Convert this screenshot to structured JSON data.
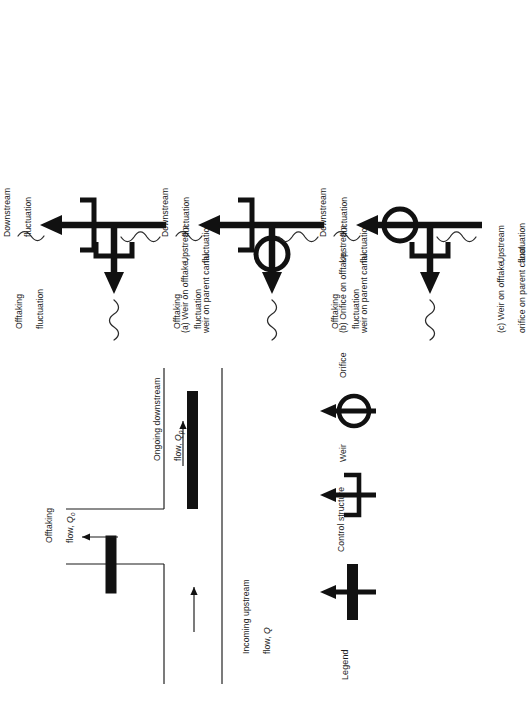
{
  "figure": {
    "type": "engineering-schematic",
    "orientation": "rotated-90-ccw",
    "background": "#ffffff",
    "ink_color": "#111111"
  },
  "main_diagram": {
    "name": "canal-offtake-schematic",
    "labels": {
      "incoming": "Incoming upstream",
      "incoming_line2": "flow, ",
      "incoming_symbol": "Q",
      "offtaking": "Offtaking",
      "offtaking_line2": "flow, ",
      "offtaking_symbol": "Q",
      "offtaking_subscript": "o",
      "ongoing": "Ongoing downstream",
      "ongoing_line2": "flow, ",
      "ongoing_symbol": "Q",
      "ongoing_subscript": "p"
    },
    "elements": [
      "parent-canal-banks",
      "offtake-branch-canal",
      "offtake-control-gate",
      "parent-canal-control-gate",
      "incoming-flow-arrow",
      "offtaking-flow-arrow",
      "ongoing-flow-arrow"
    ]
  },
  "legend": {
    "title": "Legend",
    "items": [
      {
        "key": "control-structure",
        "label": "Control structure",
        "symbol": "filled-bar-on-arrow"
      },
      {
        "key": "weir",
        "label": "Weir",
        "symbol": "u-bracket-on-arrow"
      },
      {
        "key": "orifice",
        "label": "Orifice",
        "symbol": "circle-on-arrow"
      }
    ]
  },
  "panels": [
    {
      "id": "a",
      "caption_line1": "(a) Weir on offtake,",
      "caption_line2": "weir on parent canal",
      "offtake_symbol": "weir",
      "parent_symbol": "weir",
      "labels": {
        "upstream": "Upstream",
        "upstream2": "fluctuation",
        "offtaking": "Offtaking",
        "offtaking2": "fluctuation",
        "downstream": "Downstream",
        "downstream2": "fluctuation"
      }
    },
    {
      "id": "b",
      "caption_line1": "(b) Orifice on offtake,",
      "caption_line2": "weir on parent canal",
      "offtake_symbol": "orifice",
      "parent_symbol": "weir",
      "labels": {
        "upstream": "Upstream",
        "upstream2": "fluctuation",
        "offtaking": "Offtaking",
        "offtaking2": "fluctuation",
        "downstream": "Downstream",
        "downstream2": "fluctuation"
      }
    },
    {
      "id": "c",
      "caption_line1": "(c) Weir on offtake,",
      "caption_line2": "orifice on parent canal",
      "offtake_symbol": "weir",
      "parent_symbol": "orifice",
      "labels": {
        "upstream": "Upstream",
        "upstream2": "fluctuation",
        "offtaking": "Offtaking",
        "offtaking2": "fluctuation",
        "downstream": "Downstream",
        "downstream2": "fluctuation"
      }
    }
  ]
}
